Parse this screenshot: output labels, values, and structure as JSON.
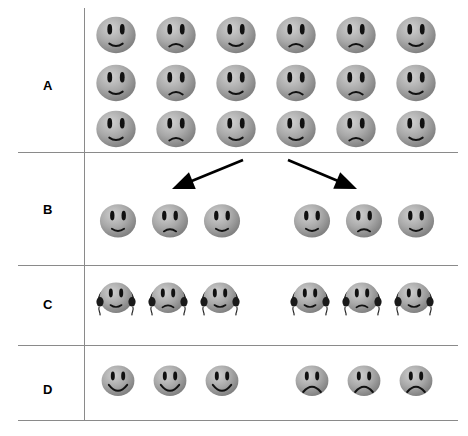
{
  "figure": {
    "title": "",
    "background_color": "#ffffff",
    "line_color": "#8a8a8a",
    "face_fill": "#a8a8a8",
    "face_shadow": "#7d7d7d",
    "face_highlight": "#d0d0d0",
    "feature_color": "#111111",
    "width": 468,
    "height": 436
  },
  "rows": [
    {
      "label": "A",
      "label_y": 78,
      "top": 8,
      "bottom": 152,
      "description": "Grid of eighteen shaded gray faces arranged in six columns and three rows, alternating faint smile and faint frown expressions.",
      "layout": "grid",
      "columns": 6,
      "lines": 3,
      "faces": [
        {
          "x": 92,
          "y": 10,
          "size": 48,
          "expression": "slight-smile",
          "mouth": "smile"
        },
        {
          "x": 152,
          "y": 10,
          "size": 48,
          "expression": "slight-frown",
          "mouth": "frown"
        },
        {
          "x": 212,
          "y": 10,
          "size": 48,
          "expression": "slight-smile",
          "mouth": "smile"
        },
        {
          "x": 272,
          "y": 10,
          "size": 48,
          "expression": "slight-frown",
          "mouth": "frown"
        },
        {
          "x": 332,
          "y": 10,
          "size": 48,
          "expression": "slight-frown",
          "mouth": "frown"
        },
        {
          "x": 392,
          "y": 10,
          "size": 48,
          "expression": "slight-smile",
          "mouth": "smile"
        },
        {
          "x": 92,
          "y": 58,
          "size": 48,
          "expression": "slight-smile",
          "mouth": "smile"
        },
        {
          "x": 152,
          "y": 58,
          "size": 48,
          "expression": "slight-frown",
          "mouth": "frown"
        },
        {
          "x": 212,
          "y": 58,
          "size": 48,
          "expression": "slight-smile",
          "mouth": "smile"
        },
        {
          "x": 272,
          "y": 58,
          "size": 48,
          "expression": "slight-frown",
          "mouth": "frown"
        },
        {
          "x": 332,
          "y": 58,
          "size": 48,
          "expression": "slight-frown",
          "mouth": "frown"
        },
        {
          "x": 392,
          "y": 58,
          "size": 48,
          "expression": "slight-smile",
          "mouth": "smile"
        },
        {
          "x": 92,
          "y": 104,
          "size": 48,
          "expression": "slight-smile",
          "mouth": "smile"
        },
        {
          "x": 152,
          "y": 104,
          "size": 48,
          "expression": "slight-frown",
          "mouth": "frown"
        },
        {
          "x": 212,
          "y": 104,
          "size": 48,
          "expression": "slight-smile",
          "mouth": "smile"
        },
        {
          "x": 272,
          "y": 104,
          "size": 48,
          "expression": "slight-smile",
          "mouth": "smile"
        },
        {
          "x": 332,
          "y": 104,
          "size": 48,
          "expression": "slight-frown",
          "mouth": "frown"
        },
        {
          "x": 392,
          "y": 104,
          "size": 48,
          "expression": "slight-smile",
          "mouth": "smile"
        }
      ]
    },
    {
      "label": "B",
      "label_y": 202,
      "top": 152,
      "bottom": 265,
      "description": "Two separated groups of three shaded gray faces, pointed to by two diverging arrows from the group above.",
      "layout": "two-groups",
      "faces": [
        {
          "x": 96,
          "y": 198,
          "size": 44,
          "expression": "slight-smile",
          "mouth": "smile",
          "group": "left"
        },
        {
          "x": 148,
          "y": 198,
          "size": 44,
          "expression": "slight-frown",
          "mouth": "frown",
          "group": "left"
        },
        {
          "x": 200,
          "y": 198,
          "size": 44,
          "expression": "slight-smile",
          "mouth": "smile",
          "group": "left"
        },
        {
          "x": 290,
          "y": 198,
          "size": 44,
          "expression": "slight-smile",
          "mouth": "smile",
          "group": "right"
        },
        {
          "x": 342,
          "y": 198,
          "size": 44,
          "expression": "slight-frown",
          "mouth": "frown",
          "group": "right"
        },
        {
          "x": 394,
          "y": 198,
          "size": 44,
          "expression": "slight-smile",
          "mouth": "smile",
          "group": "right"
        }
      ],
      "arrows": [
        {
          "name": "arrow-to-left-group",
          "x1": 243,
          "y1": 160,
          "x2": 172,
          "y2": 189,
          "direction": "down-left"
        },
        {
          "name": "arrow-to-right-group",
          "x1": 288,
          "y1": 160,
          "x2": 357,
          "y2": 189,
          "direction": "down-right"
        }
      ]
    },
    {
      "label": "C",
      "label_y": 297,
      "top": 265,
      "bottom": 345,
      "description": "The same two groups of three faces, now each wearing headphones with a headband arc over the head and earpieces on both sides.",
      "layout": "two-groups",
      "accessory": "headphones",
      "faces": [
        {
          "x": 96,
          "y": 277,
          "size": 40,
          "expression": "slight-smile",
          "mouth": "smile",
          "group": "left",
          "accessory": "headphones"
        },
        {
          "x": 148,
          "y": 277,
          "size": 40,
          "expression": "slight-frown",
          "mouth": "frown",
          "group": "left",
          "accessory": "headphones"
        },
        {
          "x": 200,
          "y": 277,
          "size": 40,
          "expression": "slight-smile",
          "mouth": "smile",
          "group": "left",
          "accessory": "headphones"
        },
        {
          "x": 290,
          "y": 277,
          "size": 40,
          "expression": "slight-smile",
          "mouth": "smile",
          "group": "right",
          "accessory": "headphones"
        },
        {
          "x": 342,
          "y": 277,
          "size": 40,
          "expression": "slight-frown",
          "mouth": "frown",
          "group": "right",
          "accessory": "headphones"
        },
        {
          "x": 394,
          "y": 277,
          "size": 40,
          "expression": "slight-smile",
          "mouth": "smile",
          "group": "right",
          "accessory": "headphones"
        }
      ]
    },
    {
      "label": "D",
      "label_y": 382,
      "top": 345,
      "bottom": 420,
      "description": "Outcome row: the left group of three faces shows broad smiles, the right group of three faces shows clear frowns.",
      "layout": "two-groups",
      "faces": [
        {
          "x": 98,
          "y": 360,
          "size": 40,
          "expression": "happy",
          "mouth": "big-smile",
          "group": "left"
        },
        {
          "x": 150,
          "y": 360,
          "size": 40,
          "expression": "happy",
          "mouth": "big-smile",
          "group": "left"
        },
        {
          "x": 202,
          "y": 360,
          "size": 40,
          "expression": "happy",
          "mouth": "big-smile",
          "group": "left"
        },
        {
          "x": 292,
          "y": 360,
          "size": 40,
          "expression": "sad",
          "mouth": "big-frown",
          "group": "right"
        },
        {
          "x": 344,
          "y": 360,
          "size": 40,
          "expression": "sad",
          "mouth": "big-frown",
          "group": "right"
        },
        {
          "x": 396,
          "y": 360,
          "size": 40,
          "expression": "sad",
          "mouth": "big-frown",
          "group": "right"
        }
      ]
    }
  ],
  "dividers": {
    "vertical_x": 84,
    "horizontal_y": [
      152,
      265,
      345,
      420
    ]
  }
}
